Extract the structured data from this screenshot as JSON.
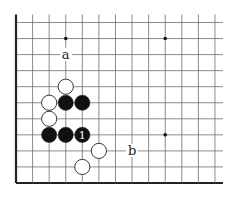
{
  "diagram": {
    "type": "go-board-fragment",
    "edges": [
      "left",
      "bottom"
    ],
    "grid": {
      "columns": 13,
      "rows": 11,
      "x0": 16,
      "y0": 22.5,
      "spacing_x": 16.58,
      "spacing_y": 16.05,
      "line_color": "#6f6f6f",
      "edge_color": "#222222"
    },
    "star_points": [
      {
        "col": 3,
        "row": 1
      },
      {
        "col": 9,
        "row": 1
      },
      {
        "col": 9,
        "row": 7
      }
    ],
    "stones": [
      {
        "color": "white",
        "col": 3,
        "row": 4
      },
      {
        "color": "white",
        "col": 2,
        "row": 5
      },
      {
        "color": "black",
        "col": 3,
        "row": 5
      },
      {
        "color": "black",
        "col": 4,
        "row": 5
      },
      {
        "color": "white",
        "col": 2,
        "row": 6
      },
      {
        "color": "black",
        "col": 2,
        "row": 7
      },
      {
        "color": "black",
        "col": 3,
        "row": 7
      },
      {
        "color": "black",
        "col": 4,
        "row": 7,
        "label": "1"
      },
      {
        "color": "white",
        "col": 5,
        "row": 8
      },
      {
        "color": "white",
        "col": 4,
        "row": 9
      }
    ],
    "markers": [
      {
        "text": "a",
        "col": 3,
        "row": 2
      },
      {
        "text": "b",
        "col": 7,
        "row": 8
      }
    ]
  }
}
